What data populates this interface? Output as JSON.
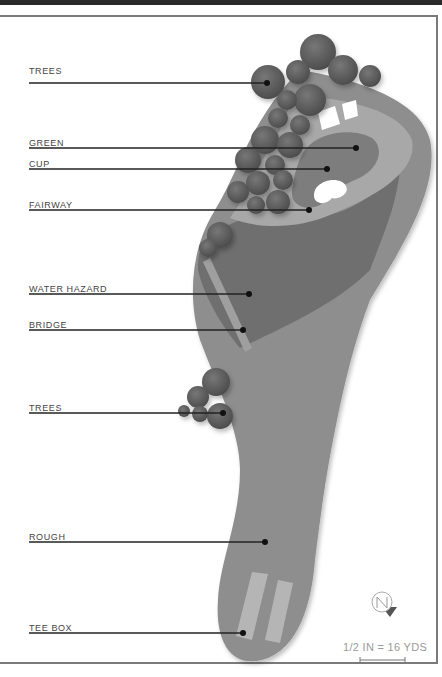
{
  "diagram": {
    "type": "golf-hole-map",
    "colors": {
      "background": "#ffffff",
      "rough": "#8c8c8c",
      "water": "#6e6e6e",
      "fairway": "#a7a7a7",
      "green": "#7c7c7c",
      "bunker": "#ffffff",
      "trees": "#5e5e5e",
      "bridge": "#9f9f9f",
      "tee_box": "#b4b4b4",
      "leader_line": "#222222"
    },
    "labels": [
      {
        "id": "trees-top",
        "text": "TREES",
        "y": 72,
        "dot_x": 267
      },
      {
        "id": "green",
        "text": "GREEN",
        "y": 148,
        "dot_x": 356
      },
      {
        "id": "cup",
        "text": "CUP",
        "y": 169,
        "dot_x": 327
      },
      {
        "id": "fairway",
        "text": "FAIRWAY",
        "y": 210,
        "dot_x": 309
      },
      {
        "id": "water-hazard",
        "text": "WATER HAZARD",
        "y": 294,
        "dot_x": 249
      },
      {
        "id": "bridge",
        "text": "BRIDGE",
        "y": 330,
        "dot_x": 243
      },
      {
        "id": "trees-mid",
        "text": "TREES",
        "y": 413,
        "dot_x": 223
      },
      {
        "id": "rough",
        "text": "ROUGH",
        "y": 542,
        "dot_x": 265
      },
      {
        "id": "tee-box",
        "text": "TEE BOX",
        "y": 633,
        "dot_x": 243
      }
    ],
    "compass": {
      "icon": "north-compass-icon",
      "letter": "N"
    },
    "scale": {
      "text": "1/2 IN = 16 YDS"
    }
  }
}
